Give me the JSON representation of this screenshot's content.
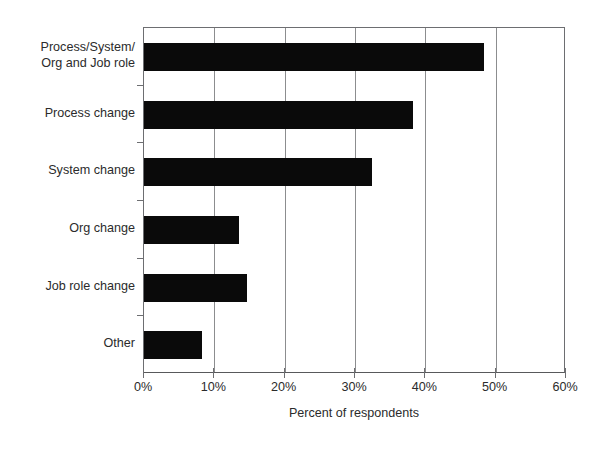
{
  "chart_data": {
    "type": "bar",
    "orientation": "horizontal",
    "title": "",
    "subtitle": "",
    "xlabel": "Percent of respondents",
    "ylabel": "",
    "categories": [
      "Process/System/\nOrg and Job role",
      "Process change",
      "System change",
      "Org change",
      "Job role change",
      "Other"
    ],
    "values": [
      48.3,
      38.3,
      32.4,
      13.5,
      14.6,
      8.2
    ],
    "xlim": [
      0,
      60
    ],
    "xticks": [
      0,
      10,
      20,
      30,
      40,
      50,
      60
    ],
    "xtick_labels": [
      "0%",
      "10%",
      "20%",
      "30%",
      "40%",
      "50%",
      "60%"
    ],
    "grid": "vertical",
    "legend": "none",
    "bar_color": "#0a0a0a",
    "axis_color": "#6d6e71",
    "background_color": "#ffffff"
  }
}
